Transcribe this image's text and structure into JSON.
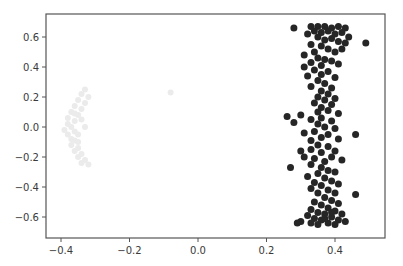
{
  "chart_data": {
    "type": "scatter",
    "title": "",
    "xlabel": "",
    "ylabel": "",
    "xlim": [
      -0.445,
      0.545
    ],
    "ylim": [
      -0.74,
      0.75
    ],
    "grid": false,
    "legend": null,
    "x_ticks": [
      -0.4,
      -0.2,
      0.0,
      0.2,
      0.4
    ],
    "x_tick_labels": [
      "−0.4",
      "−0.2",
      "0.0",
      "0.2",
      "0.4"
    ],
    "y_ticks": [
      0.6,
      0.4,
      0.2,
      0.0,
      -0.2,
      -0.4,
      -0.6
    ],
    "y_tick_labels": [
      "0.6",
      "0.4",
      "0.2",
      "0.0",
      "−0.2",
      "−0.4",
      "−0.6"
    ],
    "series": [
      {
        "name": "faint cluster",
        "color": "#ebebeb",
        "marker_radius": 3,
        "points": [
          [
            -0.33,
            0.25
          ],
          [
            -0.34,
            0.22
          ],
          [
            -0.32,
            0.2
          ],
          [
            -0.35,
            0.18
          ],
          [
            -0.33,
            0.16
          ],
          [
            -0.36,
            0.14
          ],
          [
            -0.34,
            0.12
          ],
          [
            -0.37,
            0.1
          ],
          [
            -0.35,
            0.08
          ],
          [
            -0.38,
            0.06
          ],
          [
            -0.36,
            0.04
          ],
          [
            -0.38,
            0.02
          ],
          [
            -0.37,
            0.0
          ],
          [
            -0.39,
            -0.02
          ],
          [
            -0.36,
            -0.03
          ],
          [
            -0.38,
            -0.05
          ],
          [
            -0.37,
            -0.08
          ],
          [
            -0.35,
            -0.1
          ],
          [
            -0.37,
            -0.12
          ],
          [
            -0.35,
            -0.14
          ],
          [
            -0.36,
            -0.16
          ],
          [
            -0.34,
            -0.18
          ],
          [
            -0.35,
            -0.2
          ],
          [
            -0.33,
            -0.22
          ],
          [
            -0.34,
            -0.24
          ],
          [
            -0.32,
            -0.25
          ],
          [
            -0.34,
            0.05
          ],
          [
            -0.35,
            -0.05
          ],
          [
            -0.33,
            0.0
          ],
          [
            -0.36,
            0.09
          ],
          [
            -0.36,
            -0.09
          ],
          [
            -0.08,
            0.23
          ]
        ]
      },
      {
        "name": "dark cluster",
        "color": "#262626",
        "marker_radius": 3.5,
        "points": [
          [
            0.28,
            0.66
          ],
          [
            0.33,
            0.67
          ],
          [
            0.35,
            0.67
          ],
          [
            0.37,
            0.67
          ],
          [
            0.39,
            0.66
          ],
          [
            0.41,
            0.67
          ],
          [
            0.43,
            0.66
          ],
          [
            0.34,
            0.64
          ],
          [
            0.36,
            0.63
          ],
          [
            0.38,
            0.64
          ],
          [
            0.4,
            0.62
          ],
          [
            0.42,
            0.63
          ],
          [
            0.32,
            0.62
          ],
          [
            0.44,
            0.6
          ],
          [
            0.35,
            0.6
          ],
          [
            0.37,
            0.58
          ],
          [
            0.39,
            0.59
          ],
          [
            0.41,
            0.57
          ],
          [
            0.43,
            0.56
          ],
          [
            0.49,
            0.56
          ],
          [
            0.33,
            0.55
          ],
          [
            0.36,
            0.54
          ],
          [
            0.38,
            0.52
          ],
          [
            0.34,
            0.5
          ],
          [
            0.4,
            0.5
          ],
          [
            0.42,
            0.52
          ],
          [
            0.31,
            0.48
          ],
          [
            0.35,
            0.46
          ],
          [
            0.37,
            0.45
          ],
          [
            0.39,
            0.44
          ],
          [
            0.33,
            0.43
          ],
          [
            0.36,
            0.41
          ],
          [
            0.41,
            0.42
          ],
          [
            0.31,
            0.4
          ],
          [
            0.34,
            0.38
          ],
          [
            0.38,
            0.37
          ],
          [
            0.36,
            0.35
          ],
          [
            0.32,
            0.34
          ],
          [
            0.4,
            0.33
          ],
          [
            0.35,
            0.31
          ],
          [
            0.37,
            0.29
          ],
          [
            0.33,
            0.27
          ],
          [
            0.39,
            0.26
          ],
          [
            0.36,
            0.24
          ],
          [
            0.38,
            0.22
          ],
          [
            0.35,
            0.2
          ],
          [
            0.37,
            0.18
          ],
          [
            0.4,
            0.19
          ],
          [
            0.34,
            0.16
          ],
          [
            0.39,
            0.15
          ],
          [
            0.36,
            0.13
          ],
          [
            0.38,
            0.11
          ],
          [
            0.35,
            0.1
          ],
          [
            0.41,
            0.09
          ],
          [
            0.3,
            0.08
          ],
          [
            0.33,
            0.05
          ],
          [
            0.36,
            0.06
          ],
          [
            0.39,
            0.04
          ],
          [
            0.26,
            0.07
          ],
          [
            0.28,
            0.03
          ],
          [
            0.35,
            0.02
          ],
          [
            0.37,
            0.0
          ],
          [
            0.4,
            -0.01
          ],
          [
            0.34,
            -0.03
          ],
          [
            0.31,
            -0.04
          ],
          [
            0.38,
            -0.05
          ],
          [
            0.36,
            -0.07
          ],
          [
            0.33,
            -0.09
          ],
          [
            0.41,
            -0.08
          ],
          [
            0.46,
            -0.05
          ],
          [
            0.35,
            -0.12
          ],
          [
            0.38,
            -0.13
          ],
          [
            0.33,
            -0.15
          ],
          [
            0.3,
            -0.16
          ],
          [
            0.36,
            -0.17
          ],
          [
            0.4,
            -0.16
          ],
          [
            0.27,
            -0.27
          ],
          [
            0.31,
            -0.2
          ],
          [
            0.34,
            -0.21
          ],
          [
            0.37,
            -0.23
          ],
          [
            0.39,
            -0.2
          ],
          [
            0.42,
            -0.22
          ],
          [
            0.33,
            -0.25
          ],
          [
            0.36,
            -0.27
          ],
          [
            0.38,
            -0.29
          ],
          [
            0.35,
            -0.31
          ],
          [
            0.4,
            -0.3
          ],
          [
            0.32,
            -0.33
          ],
          [
            0.37,
            -0.34
          ],
          [
            0.39,
            -0.36
          ],
          [
            0.34,
            -0.37
          ],
          [
            0.36,
            -0.39
          ],
          [
            0.41,
            -0.38
          ],
          [
            0.33,
            -0.41
          ],
          [
            0.38,
            -0.42
          ],
          [
            0.35,
            -0.44
          ],
          [
            0.4,
            -0.44
          ],
          [
            0.46,
            -0.45
          ],
          [
            0.37,
            -0.47
          ],
          [
            0.39,
            -0.49
          ],
          [
            0.34,
            -0.5
          ],
          [
            0.36,
            -0.52
          ],
          [
            0.41,
            -0.51
          ],
          [
            0.38,
            -0.54
          ],
          [
            0.33,
            -0.55
          ],
          [
            0.4,
            -0.56
          ],
          [
            0.35,
            -0.57
          ],
          [
            0.37,
            -0.58
          ],
          [
            0.42,
            -0.58
          ],
          [
            0.32,
            -0.59
          ],
          [
            0.39,
            -0.6
          ],
          [
            0.34,
            -0.61
          ],
          [
            0.36,
            -0.62
          ],
          [
            0.41,
            -0.62
          ],
          [
            0.3,
            -0.63
          ],
          [
            0.33,
            -0.64
          ],
          [
            0.38,
            -0.64
          ],
          [
            0.4,
            -0.65
          ],
          [
            0.35,
            -0.65
          ],
          [
            0.43,
            -0.63
          ],
          [
            0.29,
            -0.64
          ],
          [
            0.37,
            -0.61
          ],
          [
            0.39,
            -0.57
          ]
        ]
      }
    ]
  },
  "plot_area": {
    "left": 46,
    "top": 14,
    "right": 385,
    "bottom": 238
  },
  "mapping": {
    "x0_px": 198,
    "x_scale": 342.5,
    "y0_px": 127,
    "y_scale": 150
  }
}
